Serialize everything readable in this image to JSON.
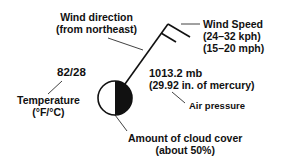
{
  "labels": {
    "wind_direction": {
      "line1": "Wind direction",
      "line2": "(from northeast)"
    },
    "wind_speed": {
      "line1": "Wind Speed",
      "line2": "(24–32 kph)",
      "line3": "(15–20 mph)"
    },
    "temperature_value": "82/28",
    "temperature": {
      "line1": "Temperature",
      "line2": "(°F/°C)"
    },
    "pressure_value": {
      "line1": "1013.2 mb",
      "line2": "(29.92 in. of mercury)"
    },
    "air_pressure": "Air pressure",
    "cloud_cover": {
      "line1": "Amount of cloud cover",
      "line2": "(about 50%)"
    }
  },
  "colors": {
    "ink": "#111111",
    "background": "#ffffff"
  }
}
